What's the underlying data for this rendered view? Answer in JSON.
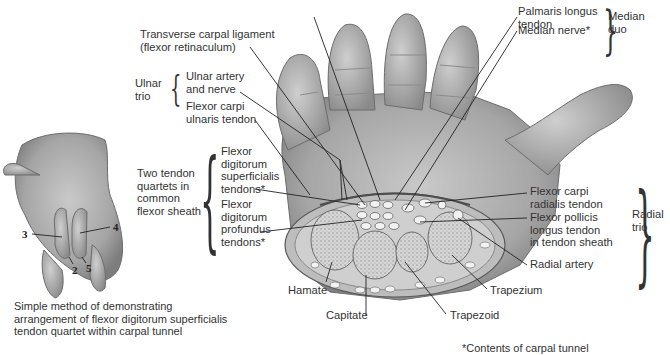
{
  "figure": {
    "type": "anatomical illustration",
    "colors": {
      "background": "#ffffff",
      "text": "#333333",
      "leader_lines": "#222222",
      "illustration_gray": "#9a9a9a"
    }
  },
  "main_labels": {
    "transverse_carpal_ligament": "Transverse carpal ligament\n(flexor retinaculum)",
    "ulnar_artery_nerve": "Ulnar artery\nand nerve",
    "flexor_carpi_ulnaris": "Flexor carpi\nulnaris tendon",
    "fds_tendons": "Flexor\ndigitorum\nsuperficialis\ntendons*",
    "fdp_tendons": "Flexor\ndigitorum\nprofundus\ntendons*",
    "palmaris_longus": "Palmaris longus\ntendon",
    "median_nerve": "Median nerve*",
    "flexor_carpi_radialis": "Flexor carpi\nradialis tendon",
    "flexor_pollicis_longus": "Flexor pollicis\nlongus tendon\nin tendon sheath",
    "radial_artery": "Radial artery",
    "hamate": "Hamate",
    "capitate": "Capitate",
    "trapezoid": "Trapezoid",
    "trapezium": "Trapezium"
  },
  "group_labels": {
    "ulnar_trio": "Ulnar\ntrio",
    "median_duo": "Median\nduo",
    "radial_trio": "Radial\ntrio",
    "two_tendon_quartets": "Two tendon\nquartets in\ncommon\nflexor sheath"
  },
  "inset": {
    "finger_numbers": [
      "3",
      "4",
      "2",
      "5"
    ],
    "caption": "Simple method of demonstrating\narrangement of flexor digitorum superficialis\ntendon quartet within carpal tunnel"
  },
  "footnote": "*Contents of carpal tunnel"
}
